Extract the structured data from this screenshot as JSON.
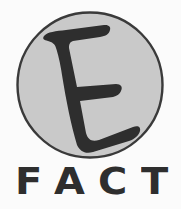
{
  "logo": {
    "emblem_letter": "E",
    "wordmark": [
      "F",
      "A",
      "C",
      "T"
    ],
    "wordmark_text": "FACT"
  },
  "colors": {
    "background": "#fbfbfb",
    "circle_fill": "#c9c9c9",
    "circle_stroke": "#3a3a3a",
    "glyph": "#2e2e2e"
  },
  "icons": {
    "emblem": "circle-e-emblem"
  }
}
